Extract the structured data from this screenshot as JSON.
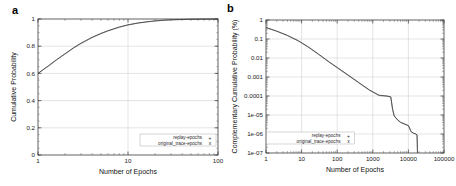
{
  "figure": {
    "panel_a_label": "a",
    "panel_b_label": "b"
  },
  "chart_data": [
    {
      "type": "line",
      "panel": "a",
      "title": "",
      "xlabel": "Number of Epochs",
      "ylabel": "Cumulative Probability",
      "xscale": "log",
      "yscale": "linear",
      "xlim": [
        1,
        100
      ],
      "ylim": [
        0,
        1
      ],
      "grid": true,
      "legend_position": "lower right",
      "xticklabels": [
        "1",
        "10",
        "100"
      ],
      "xtickvalues": [
        1,
        10,
        100
      ],
      "yticklabels": [
        "0",
        "0.2",
        "0.4",
        "0.6",
        "0.8",
        "1"
      ],
      "ytickvalues": [
        0,
        0.2,
        0.4,
        0.6,
        0.8,
        1
      ],
      "series": [
        {
          "name": "replay-epochs",
          "marker": "+",
          "x": [
            1,
            1.3,
            1.6,
            2,
            2.5,
            3,
            4,
            5,
            6,
            8,
            10,
            13,
            16,
            20,
            25,
            30,
            40,
            50,
            60,
            80,
            100
          ],
          "values": [
            0.6,
            0.655,
            0.7,
            0.745,
            0.79,
            0.822,
            0.866,
            0.894,
            0.914,
            0.941,
            0.957,
            0.971,
            0.979,
            0.986,
            0.991,
            0.994,
            0.9965,
            0.998,
            0.9987,
            0.9995,
            1.0
          ]
        },
        {
          "name": "original_trace-epochs",
          "marker": "x",
          "x": [
            1,
            1.3,
            1.6,
            2,
            2.5,
            3,
            4,
            5,
            6,
            8,
            10,
            13,
            16,
            20,
            25,
            30,
            40,
            50,
            60,
            80,
            100
          ],
          "values": [
            0.6,
            0.652,
            0.697,
            0.742,
            0.787,
            0.819,
            0.863,
            0.892,
            0.912,
            0.939,
            0.956,
            0.97,
            0.978,
            0.9855,
            0.9905,
            0.9935,
            0.996,
            0.9978,
            0.9985,
            0.9994,
            1.0
          ]
        }
      ]
    },
    {
      "type": "line",
      "panel": "b",
      "title": "",
      "xlabel": "Number of Epochs",
      "ylabel": "Complementary Cumulative Probability (%)",
      "xscale": "log",
      "yscale": "log",
      "xlim": [
        1,
        100000
      ],
      "ylim": [
        1e-07,
        1
      ],
      "grid": true,
      "legend_position": "lower left",
      "xticklabels": [
        "1",
        "10",
        "100",
        "1000",
        "10000",
        "100000"
      ],
      "xtickvalues": [
        1,
        10,
        100,
        1000,
        10000,
        100000
      ],
      "yticklabels": [
        "1",
        "0.1",
        "0.01",
        "0.001",
        "0.0001",
        "1e-05",
        "1e-06",
        "1e-07"
      ],
      "ytickvalues": [
        1,
        0.1,
        0.01,
        0.001,
        0.0001,
        1e-05,
        1e-06,
        1e-07
      ],
      "series": [
        {
          "name": "replay-epochs",
          "marker": "+",
          "x": [
            1,
            2,
            4,
            8,
            15,
            30,
            60,
            100,
            200,
            400,
            800,
            1500,
            2500,
            3200,
            3600,
            4000,
            5000,
            6000,
            8000,
            10000,
            12000,
            14000,
            16000,
            17500,
            18000
          ],
          "values": [
            0.4,
            0.26,
            0.155,
            0.082,
            0.04,
            0.016,
            0.0062,
            0.0032,
            0.0013,
            0.00052,
            0.00021,
            0.00011,
            0.0001,
            9e-05,
            2e-05,
            9e-06,
            5.5e-06,
            4.2e-06,
            3.3e-06,
            2.8e-06,
            1.3e-06,
            1.1e-06,
            1e-06,
            9e-07,
            1e-07
          ]
        },
        {
          "name": "original_trace-epochs",
          "marker": "x",
          "x": [
            1,
            2,
            4,
            8,
            15,
            30,
            60,
            100,
            200,
            400,
            800,
            1500,
            2500,
            3200,
            3600,
            4000,
            5000,
            6000,
            8000,
            10000,
            12000,
            14000,
            16000,
            17500,
            18000
          ],
          "values": [
            0.4,
            0.255,
            0.15,
            0.079,
            0.038,
            0.0152,
            0.0058,
            0.003,
            0.00122,
            0.00049,
            0.0002,
            0.000105,
            9.7e-05,
            8.8e-05,
            1.9e-05,
            8.8e-06,
            5.3e-06,
            4e-06,
            3.2e-06,
            2.7e-06,
            1.3e-06,
            1.1e-06,
            1e-06,
            9e-07,
            1e-07
          ]
        }
      ]
    }
  ]
}
